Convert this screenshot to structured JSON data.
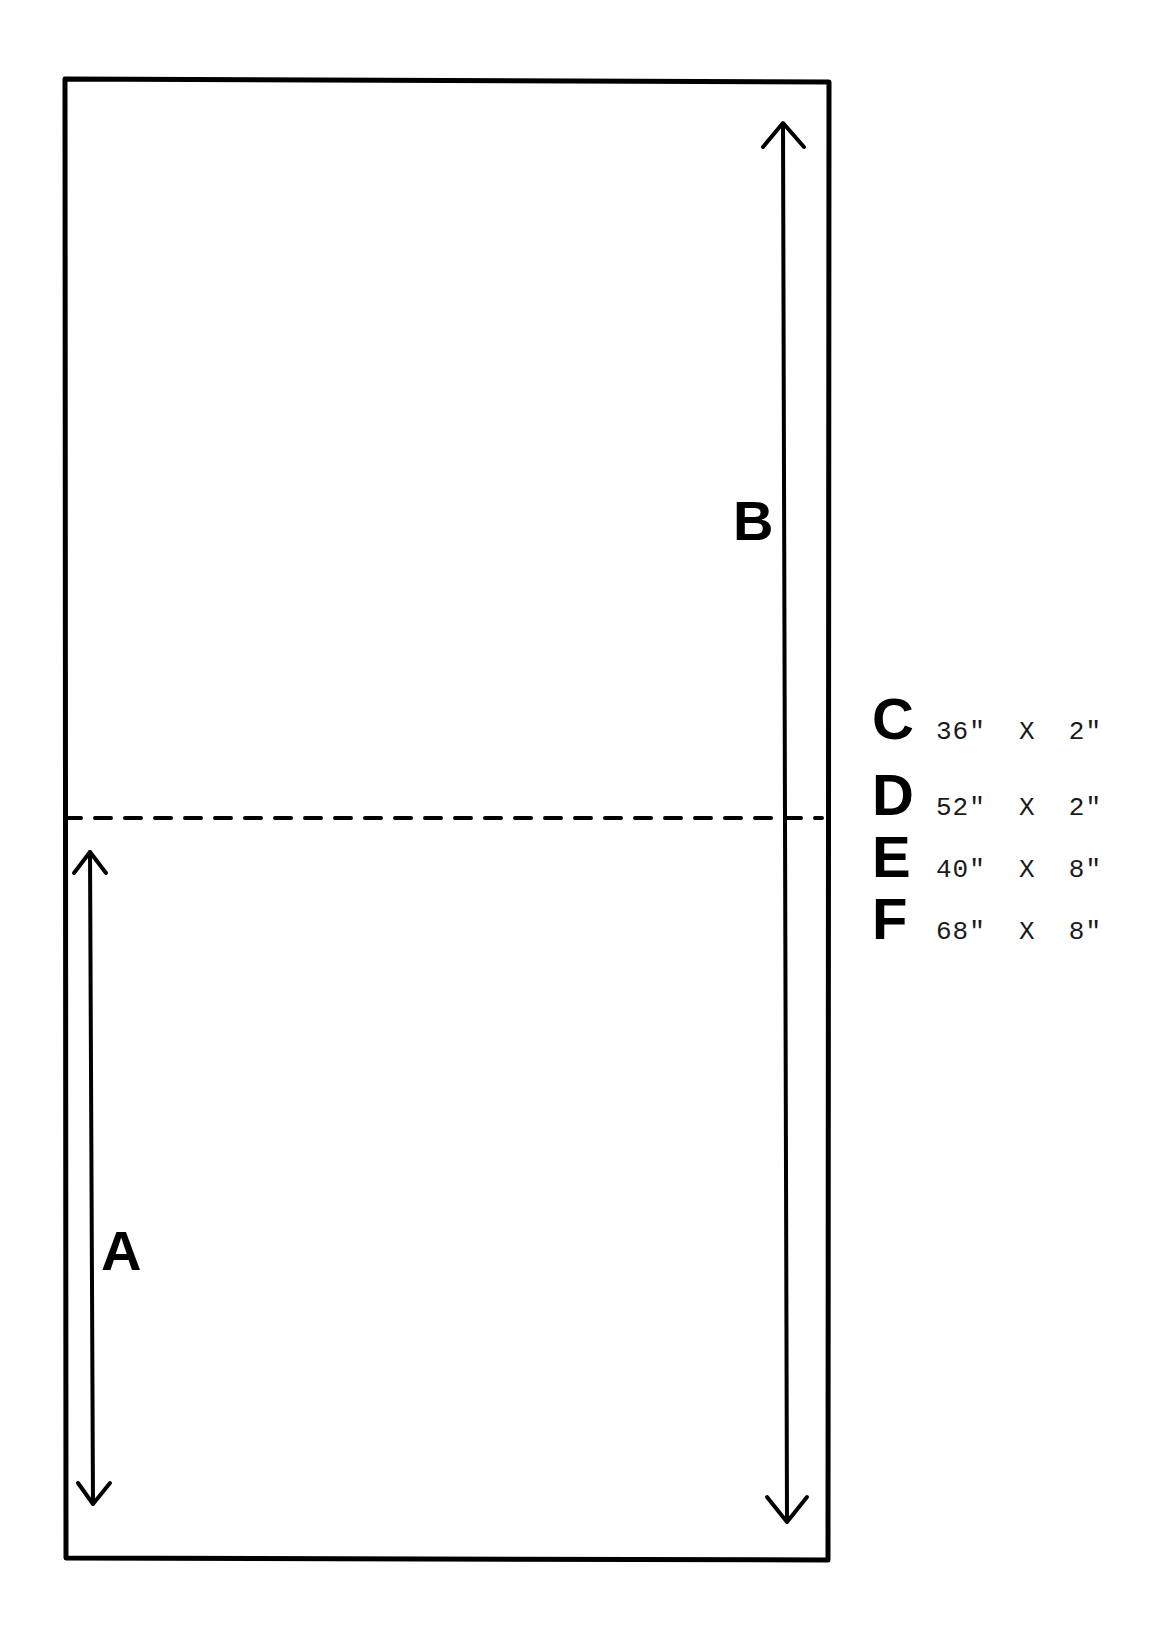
{
  "diagram": {
    "labels": {
      "a": "A",
      "b": "B"
    },
    "legend": [
      {
        "letter": "C",
        "dimensions": "36\"  X  2\""
      },
      {
        "letter": "D",
        "dimensions": "52\"  X  2\""
      },
      {
        "letter": "E",
        "dimensions": "40\"  X  8\""
      },
      {
        "letter": "F",
        "dimensions": "68\"  X  8\""
      }
    ],
    "colors": {
      "line": "#000000",
      "background": "#ffffff"
    }
  }
}
